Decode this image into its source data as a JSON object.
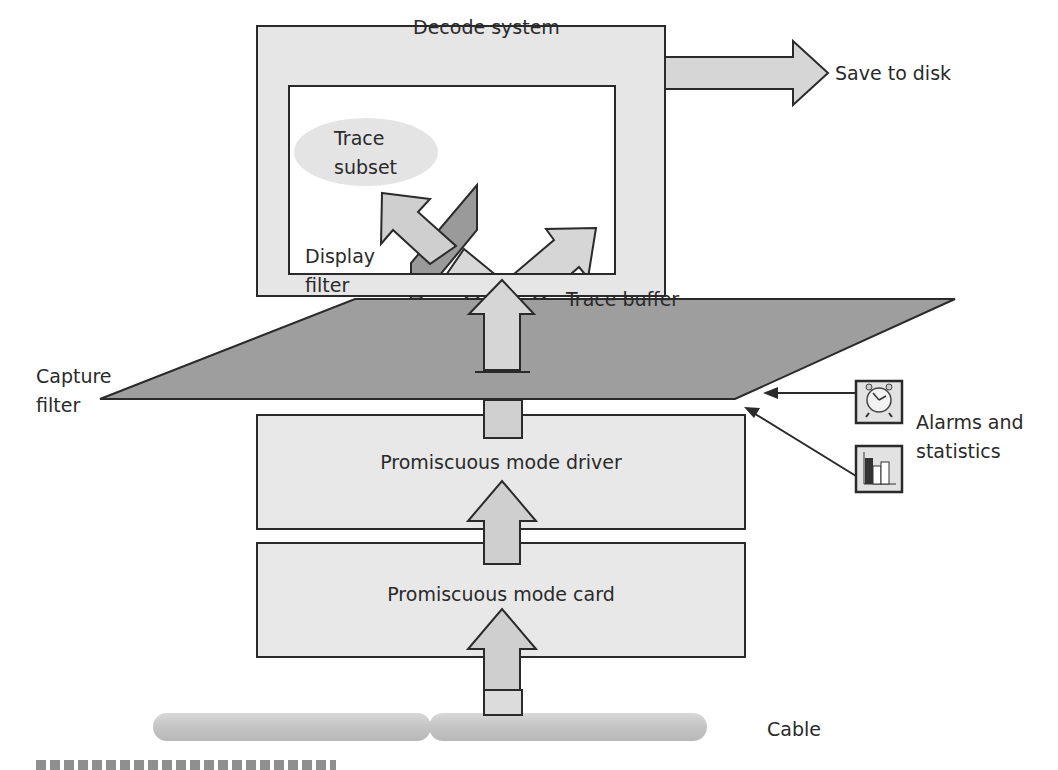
{
  "diagram": {
    "decode_system": {
      "label": "Decode system"
    },
    "save_to_disk": {
      "label": "Save to disk"
    },
    "trace_subset": {
      "label_line1": "Trace",
      "label_line2": "subset"
    },
    "display_filter": {
      "label_line1": "Display",
      "label_line2": "filter"
    },
    "trace_buffer": {
      "label": "Trace buffer"
    },
    "capture_filter": {
      "label_line1": "Capture",
      "label_line2": "filter"
    },
    "alarms_statistics": {
      "label_line1": "Alarms and",
      "label_line2": "statistics",
      "icons": [
        "alarm-clock-icon",
        "bar-chart-icon"
      ]
    },
    "promiscuous_driver": {
      "label": "Promiscuous mode driver"
    },
    "promiscuous_card": {
      "label": "Promiscuous mode card"
    },
    "cable": {
      "label": "Cable"
    }
  },
  "colors": {
    "light_fill": "#e6e6e6",
    "mid_fill": "#c8c8c8",
    "dark_fill": "#9a9a9a",
    "stroke": "#2a2a2a",
    "inner_bg": "#ffffff"
  }
}
